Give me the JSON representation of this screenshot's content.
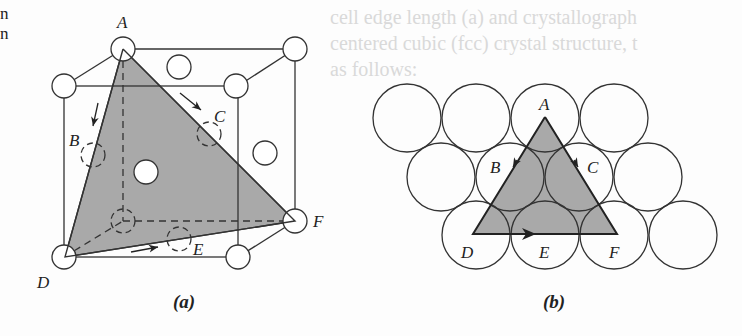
{
  "edge_text": [
    "n",
    "n"
  ],
  "ghost_text": [
    "cell edge length (a) and crystallograph",
    "centered cubic (fcc) crystal structure, t",
    "as follows:"
  ],
  "diagram_a": {
    "caption": "(a)",
    "labels": {
      "A": "A",
      "B": "B",
      "C": "C",
      "D": "D",
      "E": "E",
      "F": "F"
    },
    "plane_fill": "#a9a9a9"
  },
  "diagram_b": {
    "caption": "(b)",
    "labels": {
      "A": "A",
      "B": "B",
      "C": "C",
      "D": "D",
      "E": "E",
      "F": "F"
    },
    "plane_fill": "#a9a9a9"
  }
}
